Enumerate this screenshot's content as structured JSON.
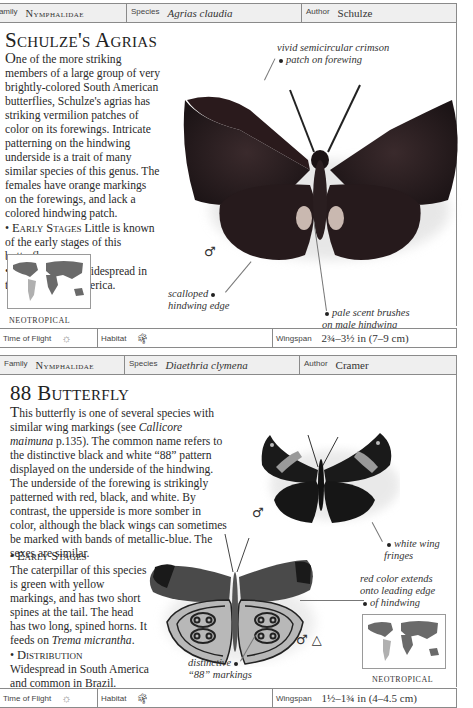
{
  "entries": [
    {
      "header": {
        "family_label": "Family",
        "family": "Nymphalidae",
        "species_label": "Species",
        "species": "Agrias claudia",
        "author_label": "Author",
        "author": "Schulze"
      },
      "title": "Schulze's Agrias",
      "description": {
        "dropcap": "O",
        "text": "ne of the more striking members of a large group of very brightly-colored South American butterflies, Schulze's agrias has striking vermilion patches of color on its forewings. Intricate patterning on the hindwing underside is a trait of many similar species of this genus. The females have orange markings on the forewings, and lack a colored hindwing patch.",
        "early_stages_label": "Early Stages",
        "early_stages": "Little is known of the early stages of this butterfly.",
        "distribution_label": "Distribution",
        "distribution": "Widespread in tropical South America."
      },
      "annotations": {
        "crimson_patch": [
          "vivid semicircular crimson",
          "patch on forewing"
        ],
        "scalloped_edge": [
          "scalloped",
          "hindwing edge"
        ],
        "scent_brushes": [
          "pale scent brushes",
          "on male hindwing"
        ]
      },
      "sex_symbol": "♂",
      "map_label": "NEOTROPICAL",
      "footer": {
        "time_of_flight_label": "Time of Flight",
        "time_of_flight_icon": "sun-icon",
        "habitat_label": "Habitat",
        "habitat_icon": "palm-tree-icon",
        "wingspan_label": "Wingspan",
        "wingspan": "2¾–3½ in (7–9 cm)"
      }
    },
    {
      "header": {
        "family_label": "Family",
        "family": "Nymphalidae",
        "species_label": "Species",
        "species": "Diaethria clymena",
        "author_label": "Author",
        "author": "Cramer"
      },
      "title": "88 Butterfly",
      "description": {
        "dropcap": "T",
        "text_before_ref": "his butterfly is one of several species with similar wing markings (see ",
        "ref": "Callicore maimuna",
        "text_after_ref": " p.135). The common name refers to the distinctive black and white “88” pattern displayed on the underside of the hindwing. The underside of the forewing is strikingly patterned with red, black, and white. By contrast, the upperside is more somber in color, although the black wings can sometimes be marked with bands of metallic-blue. The sexes are similar.",
        "early_stages_label": "Early Stages",
        "early_stages_before": "The caterpillar of this species is green with yellow markings, and has two short spines at the tail. The head has two long, spined horns. It feeds on ",
        "early_stages_plant": "Trema micrantha",
        "early_stages_after": ".",
        "distribution_label": "Distribution",
        "distribution": "Widespread in South America and common in Brazil."
      },
      "annotations": {
        "white_fringes": [
          "white wing",
          "fringes"
        ],
        "red_color": [
          "red color extends",
          "onto leading edge",
          "of hindwing"
        ],
        "markings_88": [
          "distinctive",
          "“88” markings"
        ]
      },
      "sex_symbol_upper": "♂",
      "sex_symbols_lower": "♂ △",
      "map_label": "NEOTROPICAL",
      "footer": {
        "time_of_flight_label": "Time of Flight",
        "time_of_flight_icon": "sun-icon",
        "habitat_label": "Habitat",
        "habitat_icon": "palm-tree-icon",
        "wingspan_label": "Wingspan",
        "wingspan": "1½–1¾ in (4–4.5 cm)"
      }
    }
  ],
  "colors": {
    "header_bg": "#efefef",
    "border": "#8a8a8a",
    "agrias_wing": "#2a1c1e",
    "map_land": "#6a6a6a",
    "map_highlight": "#b0b0b0"
  }
}
